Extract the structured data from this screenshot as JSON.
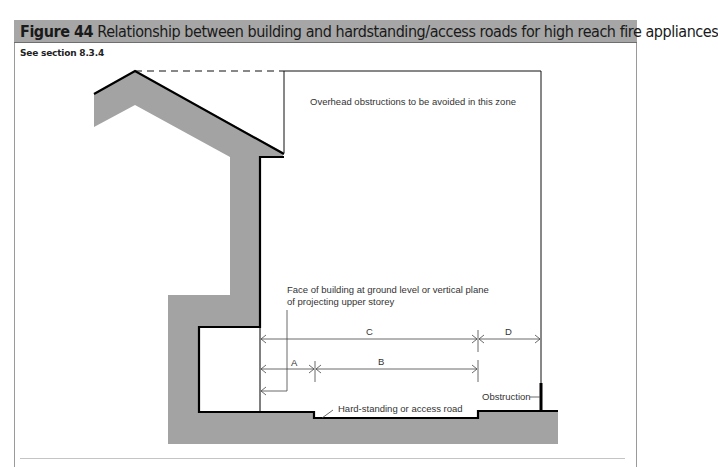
{
  "figure": {
    "number_label": "Figure 44",
    "title": "Relationship between building and hardstanding/access roads for high reach fire appliances",
    "reference": "See section 8.3.4"
  },
  "diagram": {
    "zone_label": "Overhead obstructions to be avoided in this zone",
    "face_label_line1": "Face of building at ground level or vertical plane",
    "face_label_line2": "of projecting upper storey",
    "dimensions": [
      "A",
      "B",
      "C",
      "D"
    ],
    "hardstanding_label": "Hard-standing or access road",
    "obstruction_label": "Obstruction",
    "colors": {
      "header_bg": "#a6a6a6",
      "building_fill": "#a3a3a3",
      "outline": "#000000",
      "dimension_line": "#444444"
    }
  }
}
